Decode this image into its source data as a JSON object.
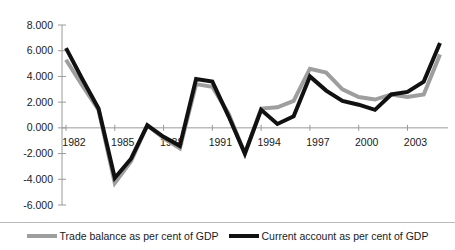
{
  "chart_data": {
    "type": "line",
    "title": "",
    "xlabel": "",
    "ylabel": "",
    "grid": false,
    "legend_position": "bottom",
    "ylim": [
      -6.0,
      8.0
    ],
    "ytick_values": [
      8.0,
      6.0,
      4.0,
      2.0,
      0.0,
      -2.0,
      -4.0,
      -6.0
    ],
    "ytick_labels": [
      "8.000",
      "6.000",
      "4.000",
      "2.000",
      "0.000",
      "-2.000",
      "-4.000",
      "-6.000"
    ],
    "xlim": [
      1982,
      2005
    ],
    "x": [
      1982,
      1983,
      1984,
      1985,
      1986,
      1987,
      1988,
      1989,
      1990,
      1991,
      1992,
      1993,
      1994,
      1995,
      1996,
      1997,
      1998,
      1999,
      2000,
      2001,
      2002,
      2003,
      2004,
      2005
    ],
    "xtick_values": [
      1982,
      1985,
      1988,
      1991,
      1994,
      1997,
      2000,
      2003
    ],
    "xtick_labels": [
      "1982",
      "1985",
      "1988",
      "1991",
      "1994",
      "1997",
      "2000",
      "2003"
    ],
    "series": [
      {
        "name": "Trade balance as per cent of GDP",
        "color": "#9e9e9e",
        "width": 4,
        "values": [
          5.3,
          3.3,
          1.4,
          -4.3,
          -2.6,
          0.2,
          -0.8,
          -1.6,
          3.4,
          3.2,
          1.1,
          -2.0,
          1.5,
          1.6,
          2.1,
          4.6,
          4.3,
          3.0,
          2.4,
          2.2,
          2.6,
          2.4,
          2.6,
          5.7
        ]
      },
      {
        "name": "Current account as per cent of GDP",
        "color": "#111111",
        "width": 4,
        "values": [
          6.2,
          3.8,
          1.5,
          -3.9,
          -2.4,
          0.2,
          -0.7,
          -1.4,
          3.8,
          3.6,
          0.9,
          -2.0,
          1.4,
          0.3,
          0.9,
          4.0,
          2.9,
          2.1,
          1.8,
          1.4,
          2.6,
          2.8,
          3.6,
          6.6
        ]
      }
    ]
  },
  "legend": {
    "entries": [
      {
        "label": "Trade balance as per cent of GDP",
        "color": "#9e9e9e"
      },
      {
        "label": "Current account as per cent of GDP",
        "color": "#111111"
      }
    ]
  }
}
